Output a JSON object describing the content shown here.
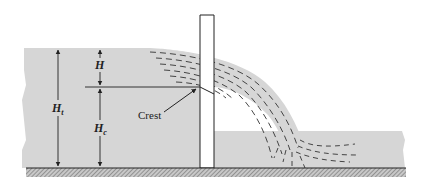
{
  "diagram": {
    "type": "sharp-crested weir cross-section",
    "labels": {
      "head": "H",
      "total_height_main": "H",
      "total_height_sub": "t",
      "crest_height_main": "H",
      "crest_height_sub": "c",
      "crest": "Crest"
    },
    "colors": {
      "water": "#d6d6d6",
      "ink": "#222222",
      "ground": "#9a9a9a",
      "background": "#ffffff",
      "weir": "#ffffff"
    }
  }
}
